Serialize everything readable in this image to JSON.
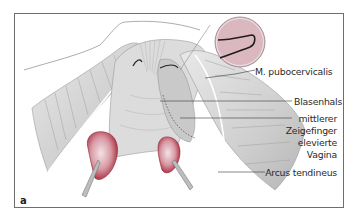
{
  "figure": {
    "panel_letter": "a",
    "labels": [
      {
        "id": "pubocervicalis",
        "text": "M. pubocervicalis"
      },
      {
        "id": "blasenhals",
        "text": "Blasenhals"
      },
      {
        "id": "zeigefinger",
        "lines": [
          "mittlerer",
          "Zeigefinger",
          "elevierte",
          "Vagina"
        ]
      },
      {
        "id": "arcus",
        "text": "Arcus tendineus"
      }
    ],
    "colors": {
      "frame": "#6e6e6e",
      "tissue": "#d9d9d9",
      "tissue_shadow": "#a8a8a8",
      "inset_fill": "#dbb7bf",
      "bulb_red": "#b0303f",
      "text": "#2a2a2a"
    }
  }
}
